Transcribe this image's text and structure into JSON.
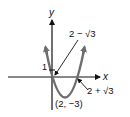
{
  "diagram": {
    "type": "parabola-graph",
    "axes": {
      "x_label": "x",
      "y_label": "y"
    },
    "labels": {
      "y_intercept": "1",
      "root_left": "2 − √3",
      "root_right": "2 + √3",
      "vertex": "(2, −3)"
    },
    "colors": {
      "curve": "#6e6e6e",
      "axes": "#111111",
      "text": "#111111"
    }
  }
}
